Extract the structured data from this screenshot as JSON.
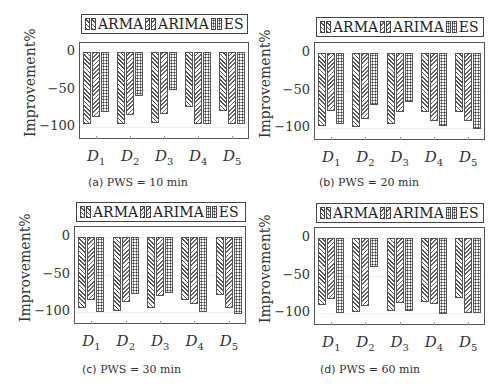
{
  "legend": {
    "entries": [
      {
        "label": "ARMA",
        "pattern": "north-east-lines"
      },
      {
        "label": "ARIMA",
        "pattern": "north-west-lines"
      },
      {
        "label": "ES",
        "pattern": "checkerboard-dots"
      }
    ]
  },
  "axis": {
    "ylabel": "Improvement%",
    "yticks": [
      "0",
      "−50",
      "−100"
    ],
    "xticks": [
      {
        "base": "D",
        "sub": "1"
      },
      {
        "base": "D",
        "sub": "2"
      },
      {
        "base": "D",
        "sub": "3"
      },
      {
        "base": "D",
        "sub": "4"
      },
      {
        "base": "D",
        "sub": "5"
      }
    ]
  },
  "panels": [
    {
      "tag": "(a)",
      "caption": "PWS = 10 min"
    },
    {
      "tag": "(b)",
      "caption": "PWS = 20 min"
    },
    {
      "tag": "(c)",
      "caption": "PWS = 30 min"
    },
    {
      "tag": "(d)",
      "caption": "PWS = 60 min"
    }
  ],
  "chart_data": [
    {
      "type": "bar",
      "title": "(a) PWS = 10 min",
      "xlabel": "",
      "ylabel": "Improvement%",
      "ylim": [
        -115,
        5
      ],
      "yticks": [
        0,
        -50,
        -100
      ],
      "grid": true,
      "legend_position": "top",
      "categories": [
        "D1",
        "D2",
        "D3",
        "D4",
        "D5"
      ],
      "series": [
        {
          "name": "ARMA",
          "values": [
            -96,
            -96,
            -95,
            -73,
            -79
          ]
        },
        {
          "name": "ARIMA",
          "values": [
            -86,
            -84,
            -83,
            -96,
            -96
          ]
        },
        {
          "name": "ES",
          "values": [
            -80,
            -58,
            -51,
            -96,
            -96
          ]
        }
      ]
    },
    {
      "type": "bar",
      "title": "(b) PWS = 20 min",
      "xlabel": "",
      "ylabel": "Improvement%",
      "ylim": [
        -115,
        5
      ],
      "yticks": [
        0,
        -50,
        -100
      ],
      "grid": true,
      "legend_position": "top",
      "categories": [
        "D1",
        "D2",
        "D3",
        "D4",
        "D5"
      ],
      "series": [
        {
          "name": "ARMA",
          "values": [
            -97,
            -98,
            -95,
            -78,
            -78
          ]
        },
        {
          "name": "ARIMA",
          "values": [
            -77,
            -88,
            -79,
            -90,
            -90
          ]
        },
        {
          "name": "ES",
          "values": [
            -95,
            -69,
            -65,
            -97,
            -101
          ]
        }
      ]
    },
    {
      "type": "bar",
      "title": "(c) PWS = 30 min",
      "xlabel": "",
      "ylabel": "Improvement%",
      "ylim": [
        -115,
        5
      ],
      "yticks": [
        0,
        -50,
        -100
      ],
      "grid": true,
      "legend_position": "top",
      "categories": [
        "D1",
        "D2",
        "D3",
        "D4",
        "D5"
      ],
      "series": [
        {
          "name": "ARMA",
          "values": [
            -95,
            -98,
            -95,
            -84,
            -77
          ]
        },
        {
          "name": "ARIMA",
          "values": [
            -84,
            -87,
            -78,
            -89,
            -94
          ]
        },
        {
          "name": "ES",
          "values": [
            -100,
            -76,
            -75,
            -100,
            -102
          ]
        }
      ]
    },
    {
      "type": "bar",
      "title": "(d) PWS = 60 min",
      "xlabel": "",
      "ylabel": "Improvement%",
      "ylim": [
        -115,
        5
      ],
      "yticks": [
        0,
        -50,
        -100
      ],
      "grid": true,
      "legend_position": "top",
      "categories": [
        "D1",
        "D2",
        "D3",
        "D4",
        "D5"
      ],
      "series": [
        {
          "name": "ARMA",
          "values": [
            -89,
            -99,
            -97,
            -85,
            -80
          ]
        },
        {
          "name": "ARIMA",
          "values": [
            -81,
            -91,
            -87,
            -88,
            -100
          ]
        },
        {
          "name": "ES",
          "values": [
            -100,
            -38,
            -97,
            -101,
            -100
          ]
        }
      ]
    }
  ]
}
